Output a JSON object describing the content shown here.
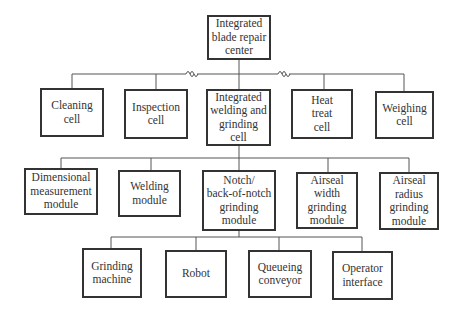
{
  "root": {
    "label": "Integrated\nblade repair\ncenter"
  },
  "cells": [
    {
      "label": "Cleaning\ncell"
    },
    {
      "label": "Inspection\ncell"
    },
    {
      "label": "Integrated\nwelding and\ngrinding\ncell"
    },
    {
      "label": "Heat\ntreat\ncell"
    },
    {
      "label": "Weighing\ncell"
    }
  ],
  "modules": [
    {
      "label": "Dimensional\nmeasurement\nmodule"
    },
    {
      "label": "Welding\nmodule"
    },
    {
      "label": "Notch/\nback-of-notch\ngrinding\nmodule"
    },
    {
      "label": "Airseal\nwidth\ngrinding\nmodule"
    },
    {
      "label": "Airseal\nradius\ngrinding\nmodule"
    }
  ],
  "components": [
    {
      "label": "Grinding\nmachine"
    },
    {
      "label": "Robot"
    },
    {
      "label": "Queueing\nconveyor"
    },
    {
      "label": "Operator\ninterface"
    }
  ],
  "break_symbols": [
    "∫∫",
    "∫∫"
  ],
  "colors": {
    "line": "#555555",
    "border": "#333333",
    "background": "#ffffff"
  }
}
